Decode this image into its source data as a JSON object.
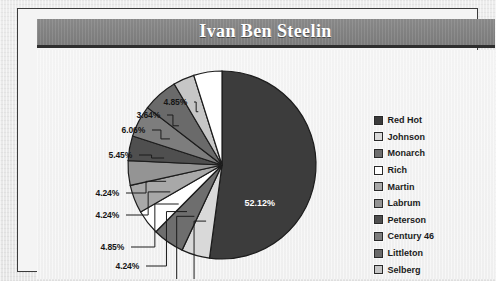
{
  "chart_title": "Ivan Ben Steelin",
  "legend": {
    "items": [
      {
        "label": "Red Hot",
        "color": "#3c3c3c"
      },
      {
        "label": "Johnson",
        "color": "#d9d9d9"
      },
      {
        "label": "Monarch",
        "color": "#6e6e6e"
      },
      {
        "label": "Rich",
        "color": "#ffffff"
      },
      {
        "label": "Martin",
        "color": "#a8a8a8"
      },
      {
        "label": "Labrum",
        "color": "#949494"
      },
      {
        "label": "Peterson",
        "color": "#4f4f4f"
      },
      {
        "label": "Century 46",
        "color": "#7d7d7d"
      },
      {
        "label": "Littleton",
        "color": "#6a6a6a"
      },
      {
        "label": "Selberg",
        "color": "#c6c6c6"
      },
      {
        "label": "Baker",
        "color": "#ffffff"
      }
    ]
  },
  "callouts": [
    {
      "text": "4.85%",
      "left": 127,
      "top": 47
    },
    {
      "text": "3.64%",
      "left": 100,
      "top": 60
    },
    {
      "text": "6.06%",
      "left": 85,
      "top": 75
    },
    {
      "text": "5.45%",
      "left": 72,
      "top": 100
    },
    {
      "text": "4.24%",
      "left": 59,
      "top": 138
    },
    {
      "text": "4.24%",
      "left": 59,
      "top": 160
    },
    {
      "text": "4.85%",
      "left": 64,
      "top": 192
    },
    {
      "text": "4.24%",
      "left": 79,
      "top": 211
    },
    {
      "text": "5.45%",
      "left": 92,
      "top": 227
    },
    {
      "text": "4.85%",
      "left": 115,
      "top": 251
    }
  ],
  "inner_label": {
    "text": "52.12%",
    "left": 208,
    "top": 148
  },
  "chart_data": {
    "type": "pie",
    "title": "Ivan Ben Steelin",
    "xlabel": "",
    "ylabel": "",
    "legend_position": "right",
    "grid": false,
    "units": "percent",
    "start_angle_deg": 0,
    "direction": "clockwise",
    "categories": [
      "Red Hot",
      "Johnson",
      "Monarch",
      "Rich",
      "Martin",
      "Labrum",
      "Peterson",
      "Century 46",
      "Littleton",
      "Selberg",
      "Baker"
    ],
    "values": [
      52.12,
      4.85,
      5.45,
      4.24,
      4.85,
      4.24,
      4.24,
      5.45,
      6.06,
      3.64,
      4.85
    ],
    "colors": [
      "#3c3c3c",
      "#d9d9d9",
      "#6e6e6e",
      "#ffffff",
      "#a8a8a8",
      "#949494",
      "#4f4f4f",
      "#7d7d7d",
      "#6a6a6a",
      "#c6c6c6",
      "#ffffff"
    ],
    "data_labels": [
      "52.12%",
      "4.85%",
      "5.45%",
      "4.24%",
      "4.85%",
      "4.24%",
      "4.24%",
      "5.45%",
      "6.06%",
      "3.64%",
      "4.85%"
    ],
    "center_px": [
      185,
      115
    ],
    "radius_px": 94
  }
}
